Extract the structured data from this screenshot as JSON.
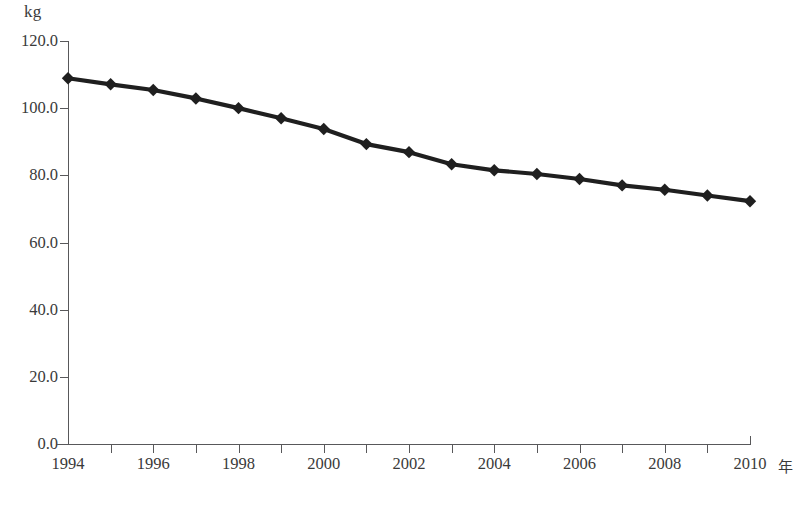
{
  "chart_data": {
    "type": "line",
    "title": "",
    "subtitle": "",
    "xlabel": "年",
    "ylabel": "kg",
    "x": [
      1994,
      1995,
      1996,
      1997,
      1998,
      1999,
      2000,
      2001,
      2002,
      2003,
      2004,
      2005,
      2006,
      2007,
      2008,
      2009,
      2010
    ],
    "categories": [
      "1994",
      "1995",
      "1996",
      "1997",
      "1998",
      "1999",
      "2000",
      "2001",
      "2002",
      "2003",
      "2004",
      "2005",
      "2006",
      "2007",
      "2008",
      "2009",
      "2010"
    ],
    "values": [
      108.9,
      107.1,
      105.4,
      102.9,
      100.0,
      97.0,
      93.8,
      89.3,
      86.9,
      83.3,
      81.5,
      80.4,
      78.9,
      77.0,
      75.7,
      74.0,
      72.3
    ],
    "series": [
      {
        "name": "",
        "values": [
          108.9,
          107.1,
          105.4,
          102.9,
          100.0,
          97.0,
          93.8,
          89.3,
          86.9,
          83.3,
          81.5,
          80.4,
          78.9,
          77.0,
          75.7,
          74.0,
          72.3
        ]
      }
    ],
    "ylim": [
      0.0,
      120.0
    ],
    "xlim": [
      1994,
      2010
    ],
    "ytick_labels": [
      "120.0",
      "100.0",
      "80.0",
      "60.0",
      "40.0",
      "20.0",
      "0.0"
    ],
    "ytick_values": [
      120.0,
      100.0,
      80.0,
      60.0,
      40.0,
      20.0,
      0.0
    ],
    "xtick_labels": [
      "1994",
      "1996",
      "1998",
      "2000",
      "2002",
      "2004",
      "2006",
      "2008",
      "2010"
    ],
    "xtick_values": [
      1994,
      1996,
      1998,
      2000,
      2002,
      2004,
      2006,
      2008,
      2010
    ],
    "grid": false,
    "legend": false,
    "legend_position": "none",
    "marker": "diamond",
    "line_color": "#1f1f1f",
    "marker_color": "#1f1f1f",
    "axis_color": "#58585a",
    "background_color": "#ffffff",
    "annotations": []
  },
  "axes": {
    "y_unit": "kg",
    "x_unit": "年"
  }
}
